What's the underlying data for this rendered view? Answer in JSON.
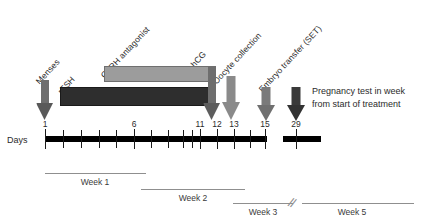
{
  "diagram": {
    "title_note": {
      "line1": "Pregnancy test in week",
      "line2": "from start of treatment"
    },
    "axis": {
      "label": "Days",
      "day_labels": [
        "1",
        "6",
        "11",
        "12",
        "13",
        "15",
        "29"
      ]
    },
    "treatments": [
      {
        "name": "menses",
        "label": "Menses",
        "color": "#6e6e6e"
      },
      {
        "name": "rfsh",
        "label": "rFSH",
        "color": "#2e2e2e"
      },
      {
        "name": "gnrh-antagonist",
        "label": "GnRH antagonist",
        "color": "#9c9c9c"
      },
      {
        "name": "hcg",
        "label": "hCG",
        "color": "#6e6e6e"
      },
      {
        "name": "oocyte-collection",
        "label": "Oocyte collection",
        "color": "#8a8a8a"
      },
      {
        "name": "embryo-transfer",
        "label": "Embryo transfer (SET)",
        "color": "#7a7a7a"
      }
    ],
    "weeks": [
      {
        "label": "Week 1"
      },
      {
        "label": "Week 2"
      },
      {
        "label": "Week 3"
      },
      {
        "label": "Week 5"
      }
    ],
    "colors": {
      "axis": "#000000",
      "bar_light": "#9c9c9c",
      "bar_dark": "#2e2e2e",
      "week_line": "#8f8f8f",
      "text": "#2b2b2b"
    }
  }
}
